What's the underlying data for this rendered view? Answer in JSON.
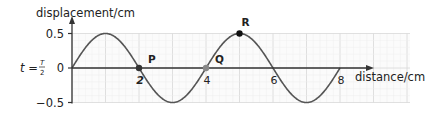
{
  "chart_data": {
    "type": "line",
    "title": "",
    "time_label": "t = T/2",
    "time_label_parts": {
      "t": "t =",
      "num": "T",
      "den": "2"
    },
    "xlabel": "distance/cm",
    "ylabel": "displacement/cm",
    "xlim": [
      0,
      10
    ],
    "ylim": [
      -0.5,
      0.5
    ],
    "x_ticks": [
      {
        "value": 2,
        "label": "2"
      },
      {
        "value": 4,
        "label": "4"
      },
      {
        "value": 6,
        "label": "6"
      },
      {
        "value": 8,
        "label": "8"
      }
    ],
    "y_ticks": [
      {
        "value": 0.5,
        "label": "0.5"
      },
      {
        "value": 0,
        "label": "0"
      },
      {
        "value": -0.5,
        "label": "−0.5"
      }
    ],
    "grid": true,
    "series": [
      {
        "name": "wave",
        "function": "y = 0.5 sin(2πx/4)",
        "amplitude": 0.5,
        "wavelength": 4,
        "x": [
          0,
          1,
          2,
          3,
          4,
          5,
          6,
          7,
          8
        ],
        "y": [
          0,
          0.5,
          0,
          -0.5,
          0,
          0.5,
          0,
          -0.5,
          0
        ]
      }
    ],
    "annotations": [
      {
        "label": "P",
        "x": 2,
        "y": 0,
        "color": "#333333"
      },
      {
        "label": "Q",
        "x": 4,
        "y": 0,
        "color": "#888888"
      },
      {
        "label": "R",
        "x": 5,
        "y": 0.5,
        "color": "#111111"
      }
    ]
  },
  "colors": {
    "axis": "#333333",
    "curve": "#555555",
    "grid_major": "#d8d8d8",
    "grid_minor": "#eeeeee"
  }
}
